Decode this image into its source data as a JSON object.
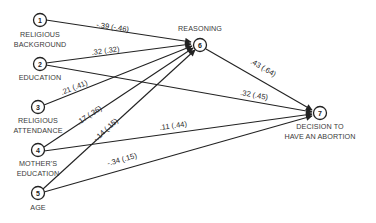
{
  "diagram": {
    "type": "path-diagram",
    "nodes": [
      {
        "id": "1",
        "number": "1",
        "label_line1": "RELIGIOUS",
        "label_line2": "BACKGROUND"
      },
      {
        "id": "2",
        "number": "2",
        "label_line1": "EDUCATION",
        "label_line2": ""
      },
      {
        "id": "3",
        "number": "3",
        "label_line1": "RELIGIOUS",
        "label_line2": "ATTENDANCE"
      },
      {
        "id": "4",
        "number": "4",
        "label_line1": "MOTHER'S",
        "label_line2": "EDUCATION"
      },
      {
        "id": "5",
        "number": "5",
        "label_line1": "AGE",
        "label_line2": ""
      },
      {
        "id": "6",
        "number": "6",
        "label_line1": "REASONING",
        "label_line2": ""
      },
      {
        "id": "7",
        "number": "7",
        "label_line1": "DECISION TO",
        "label_line2": "HAVE AN ABORTION"
      }
    ],
    "edges": [
      {
        "from": "1",
        "to": "6",
        "label": "-.39 (-.46)"
      },
      {
        "from": "2",
        "to": "6",
        "label": ".32 (.32)"
      },
      {
        "from": "2",
        "to": "7",
        "label": ".32 (.45)"
      },
      {
        "from": "3",
        "to": "6",
        "label": ".21 (.41)"
      },
      {
        "from": "4",
        "to": "6",
        "label": ".17 (.36)"
      },
      {
        "from": "4",
        "to": "7",
        "label": ".11 (.44)"
      },
      {
        "from": "5",
        "to": "6",
        "label": "-.14 (.15)"
      },
      {
        "from": "5",
        "to": "7",
        "label": "-.34 (.15)"
      },
      {
        "from": "6",
        "to": "7",
        "label": ".43 (.64)"
      }
    ]
  }
}
